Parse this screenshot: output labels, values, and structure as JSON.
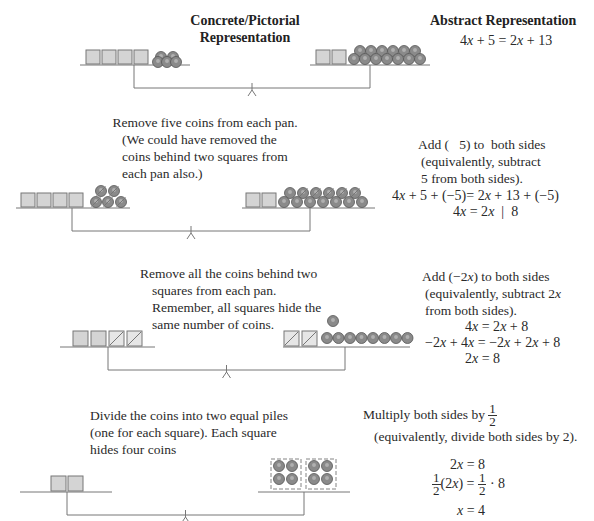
{
  "headers": {
    "concrete": [
      "Concrete/Pictorial",
      "Representation"
    ],
    "abstract": "Abstract Representation"
  },
  "colors": {
    "square_fill": "#d4d4d4",
    "square_stroke": "#777777",
    "coin_fill": "#8a8a8a",
    "coin_stroke": "#555555",
    "line": "#777777"
  },
  "steps": [
    {
      "concrete_text": [],
      "abstract_text": [],
      "equations": [
        "4x + 5 = 2x + 13"
      ],
      "left_pan": {
        "squares": 4,
        "crossed_squares": 0,
        "coins": 5,
        "crossed_coins": 0
      },
      "right_pan": {
        "squares": 2,
        "crossed_squares": 0,
        "coins": 13,
        "crossed_coins": 0
      }
    },
    {
      "concrete_text": [
        "Remove five coins from each pan.",
        "(We could have removed the",
        "coins behind two squares from",
        "each pan also.)"
      ],
      "abstract_text": [
        "Add (   5) to  both sides",
        "(equivalently, subtract",
        "5 from both sides)."
      ],
      "equations": [
        "4x + 5 + (−5)= 2x + 13 + (−5)",
        "4x = 2x  |  8"
      ],
      "left_pan": {
        "squares": 4,
        "crossed_squares": 0,
        "coins": 5,
        "crossed_coins": 5
      },
      "right_pan": {
        "squares": 2,
        "crossed_squares": 0,
        "coins": 13,
        "crossed_coins": 5
      }
    },
    {
      "concrete_text": [
        "Remove all the coins behind two",
        "squares from each pan.",
        "Remember, all squares hide the",
        "same number of coins."
      ],
      "abstract_text": [
        "Add (−2x) to both sides",
        "(equivalently, subtract 2x",
        "from both sides)."
      ],
      "equations": [
        "4x = 2x + 8",
        "−2x + 4x = −2x + 2x + 8",
        "2x = 8"
      ],
      "left_pan": {
        "squares": 4,
        "crossed_squares": 2,
        "coins": 0,
        "crossed_coins": 0
      },
      "right_pan": {
        "squares": 2,
        "crossed_squares": 2,
        "coins": 8,
        "crossed_coins": 0
      }
    },
    {
      "concrete_text": [
        "Divide the coins into two equal piles",
        "(one for each square). Each square",
        "hides four coins"
      ],
      "abstract_text": [
        "Multiply both sides by",
        "(equivalently, divide both sides by 2)."
      ],
      "fraction": {
        "num": "1",
        "den": "2"
      },
      "equations": [
        "2x = 8",
        "(2x) = · 8",
        "x = 4"
      ],
      "left_pan": {
        "squares": 2,
        "crossed_squares": 0,
        "coins": 0,
        "crossed_coins": 0
      },
      "right_pan": {
        "squares": 0,
        "crossed_squares": 0,
        "coins": 8,
        "piles": 2,
        "coins_per_pile": 4
      }
    }
  ]
}
